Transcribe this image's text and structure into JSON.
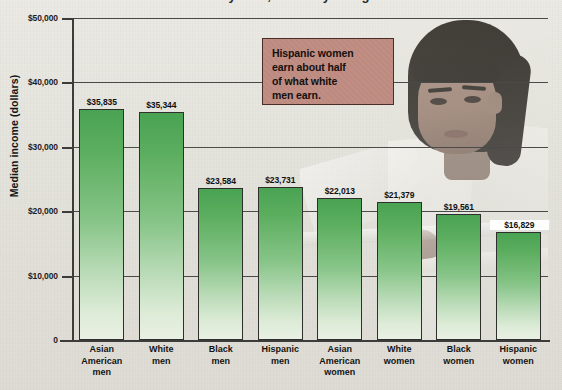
{
  "chart_data": {
    "type": "bar",
    "title": "Median income by race, ethnicity and gender",
    "xlabel": "",
    "ylabel": "Median income (dollars)",
    "ylim": [
      0,
      50000
    ],
    "grid": true,
    "legend_position": "none",
    "categories": [
      "Asian American men",
      "White men",
      "Black men",
      "Hispanic men",
      "Asian American women",
      "White women",
      "Black women",
      "Hispanic women"
    ],
    "category_lines": [
      [
        "Asian",
        "American",
        "men"
      ],
      [
        "White",
        "men"
      ],
      [
        "Black",
        "men"
      ],
      [
        "Hispanic",
        "men"
      ],
      [
        "Asian",
        "American",
        "women"
      ],
      [
        "White",
        "women"
      ],
      [
        "Black",
        "women"
      ],
      [
        "Hispanic",
        "women"
      ]
    ],
    "values": [
      35835,
      35344,
      23584,
      23731,
      22013,
      21379,
      19561,
      16829
    ],
    "value_labels": [
      "$35,835",
      "$35,344",
      "$23,584",
      "$23,731",
      "$22,013",
      "$21,379",
      "$19,561",
      "$16,829"
    ],
    "y_ticks": [
      0,
      10000,
      20000,
      30000,
      40000,
      50000
    ],
    "y_tick_labels": [
      "0",
      "$10,000",
      "$20,000",
      "$30,000",
      "$40,000",
      "$50,000"
    ],
    "bar_color": "#5cae5f",
    "bar_gradient_bottom": "#e9f0e4",
    "bar_border_color": "#2f2f2d"
  },
  "annotation": {
    "line1": "Hispanic women",
    "line2": "earn about half",
    "line3": "of what white",
    "line4": "men earn.",
    "background_color": "#c08c82",
    "border_color": "#4a2e28"
  },
  "photo": {
    "description": "businesswoman-photo"
  }
}
